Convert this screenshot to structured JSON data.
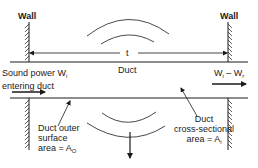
{
  "diagram": {
    "labels": {
      "wall_left": "Wall",
      "wall_right": "Wall",
      "length_symbol": "t",
      "duct": "Duct",
      "sound_power_line1": "Sound power W",
      "sound_power_sub": "i",
      "sound_power_line2": "entering duct",
      "exit_power_main": "W",
      "exit_power_sub1": "i",
      "exit_power_mid": " – W",
      "exit_power_sub2": "r",
      "outer_line1": "Duct outer",
      "outer_line2": "surface",
      "outer_line3": "area  =  A",
      "outer_sub": "O",
      "cross_line1": "Duct",
      "cross_line2": "cross-sectional",
      "cross_line3": "area  =  A",
      "cross_sub": "i"
    },
    "colors": {
      "stroke": "#1a1a1a",
      "background": "#ffffff"
    }
  }
}
